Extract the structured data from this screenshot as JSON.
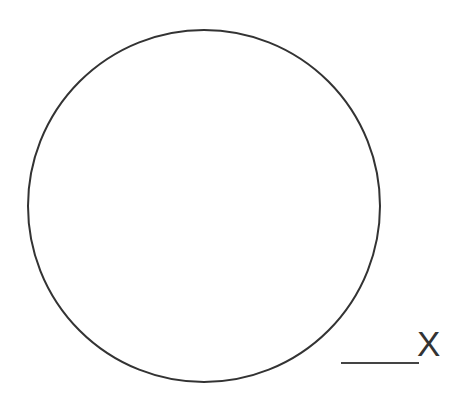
{
  "diagram": {
    "shapes": [
      {
        "type": "circle",
        "center": [
          204,
          206
        ],
        "radius": 176,
        "stroke": "#333333",
        "stroke_width": 2,
        "fill": "none"
      },
      {
        "type": "line",
        "from": [
          341,
          363
        ],
        "to": [
          419,
          363
        ],
        "stroke": "#444444",
        "stroke_width": 2
      }
    ],
    "label": {
      "text": "X",
      "color": "#333333"
    }
  }
}
